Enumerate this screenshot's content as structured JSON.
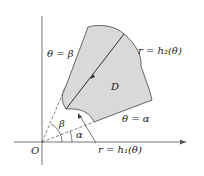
{
  "diagram": {
    "region_label": "D",
    "origin_label": "O",
    "ray_beta_label": "θ = β",
    "ray_alpha_label": "θ = α",
    "outer_curve_label": "r = h₂(θ)",
    "inner_curve_label": "r = h₁(θ)",
    "angle_beta": "β",
    "angle_alpha": "α",
    "colors": {
      "region_fill": "#d9d9d9",
      "stroke": "#444444",
      "background": "#ffffff"
    }
  }
}
